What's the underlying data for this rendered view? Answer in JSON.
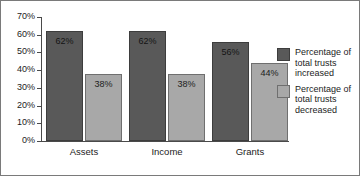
{
  "chart_data": {
    "type": "bar",
    "title": "",
    "xlabel": "",
    "ylabel": "",
    "categories": [
      "Assets",
      "Income",
      "Grants"
    ],
    "series": [
      {
        "name": "Percentage of total trusts increased",
        "color": "#595959",
        "values": [
          62,
          62,
          56
        ],
        "labels": [
          "62%",
          "62%",
          "56%"
        ]
      },
      {
        "name": "Percentage of total trusts decreased",
        "color": "#a8a8a8",
        "values": [
          38,
          38,
          44
        ],
        "labels": [
          "38%",
          "38%",
          "44%"
        ]
      }
    ],
    "ylim": [
      0,
      70
    ],
    "ytick_values": [
      70,
      60,
      50,
      40,
      30,
      20,
      10,
      0
    ],
    "ytick_labels": [
      "70%",
      "60%",
      "50%",
      "40%",
      "30%",
      "20%",
      "10%",
      "0%"
    ],
    "grid": false,
    "legend_position": "right"
  },
  "legend": {
    "entries": [
      {
        "label": "Percentage of total trusts increased",
        "swatch": "increased"
      },
      {
        "label": "Percentage of total trusts decreased",
        "swatch": "decreased"
      }
    ]
  }
}
